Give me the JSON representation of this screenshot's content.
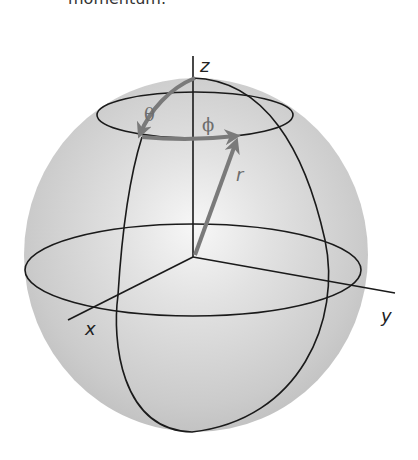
{
  "page": {
    "caption_fragment": "momentum."
  },
  "diagram": {
    "colors": {
      "sphere_fill": "#c8c8c8",
      "sphere_highlight": "#f4f4f4",
      "line": "#1a1a1a",
      "vector": "#7a7a7a"
    },
    "labels": {
      "z_axis": "z",
      "x_axis": "x",
      "y_axis": "y",
      "theta": "θ",
      "phi": "ϕ",
      "radius": "r"
    },
    "elements": [
      {
        "name": "sphere",
        "type": "circle"
      },
      {
        "name": "polar-circle",
        "type": "ellipse",
        "label": "latitude circle at angle θ"
      },
      {
        "name": "equator",
        "type": "ellipse"
      },
      {
        "name": "meridian",
        "type": "ellipse"
      },
      {
        "name": "z-axis",
        "type": "line",
        "label": "z"
      },
      {
        "name": "x-axis",
        "type": "line",
        "label": "x"
      },
      {
        "name": "y-axis",
        "type": "line",
        "label": "y"
      },
      {
        "name": "radius-vector",
        "type": "arrow",
        "label": "r"
      },
      {
        "name": "theta-arc",
        "type": "arrow",
        "label": "θ"
      },
      {
        "name": "phi-arc",
        "type": "arrow",
        "label": "ϕ"
      }
    ]
  }
}
